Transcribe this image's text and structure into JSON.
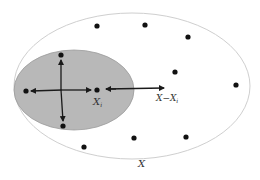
{
  "diagram": {
    "outer_set": {
      "label": "X",
      "cx": 132,
      "cy": 86,
      "rx": 118,
      "ry": 73,
      "stroke": "#cfcfcf"
    },
    "inner_set": {
      "cx": 74,
      "cy": 90,
      "rx": 60,
      "ry": 40,
      "fill": "#b8b8b8",
      "stroke": "#9a9a9a"
    },
    "center_point": {
      "label": "X_i",
      "label_main": "X",
      "label_sub": "i",
      "x": 97,
      "y": 90
    },
    "complement_arrow": {
      "label": "X−X_i",
      "label_main": "X−X",
      "label_sub": "i",
      "x1": 106,
      "y1": 89,
      "x2": 164,
      "y2": 88
    },
    "inner_points": [
      {
        "x": 61,
        "y": 55
      },
      {
        "x": 26,
        "y": 91
      },
      {
        "x": 63,
        "y": 126
      }
    ],
    "outer_points": [
      {
        "x": 97,
        "y": 26
      },
      {
        "x": 145,
        "y": 25
      },
      {
        "x": 188,
        "y": 37
      },
      {
        "x": 175,
        "y": 72
      },
      {
        "x": 236,
        "y": 85
      },
      {
        "x": 134,
        "y": 138
      },
      {
        "x": 186,
        "y": 137
      },
      {
        "x": 84,
        "y": 147
      }
    ],
    "colors": {
      "dot": "#111111",
      "arrow": "#1a1a1a"
    }
  }
}
